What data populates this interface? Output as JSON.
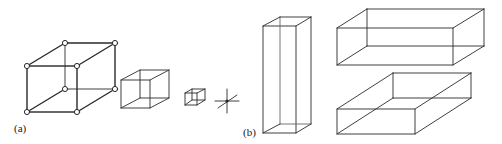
{
  "diagram": {
    "panels": [
      {
        "label": "(a)",
        "description": "Lattice cube shrinking to a point",
        "shapes": [
          "cube-with-vertex-atoms",
          "medium-cube",
          "small-cube",
          "point-cross"
        ]
      },
      {
        "label": "(b)",
        "description": "Rectangular prisms of differing proportions",
        "shapes": [
          "tall-prism",
          "long-flat-prism",
          "wide-flat-prism"
        ]
      }
    ],
    "colors": {
      "line": "#2a2a2a",
      "background": "#ffffff"
    }
  }
}
